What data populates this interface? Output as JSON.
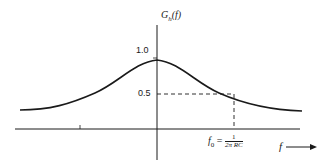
{
  "diagram": {
    "type": "lowpass-filter-frequency-response",
    "y_axis_label": {
      "main": "G",
      "subscript": "h",
      "arg": "(f)"
    },
    "x_axis_label": "f",
    "y_ticks": [
      {
        "label": "1.0",
        "value": 1.0
      },
      {
        "label": "0.5",
        "value": 0.5
      }
    ],
    "cutoff_label": {
      "lhs_main": "f",
      "lhs_sub": "0",
      "equals": "=",
      "numerator": "1",
      "denominator": "2π RC"
    },
    "colors": {
      "ink": "#1a1a1a",
      "background": "#ffffff"
    }
  }
}
